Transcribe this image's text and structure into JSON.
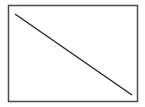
{
  "diagram": {
    "frame": {
      "x": 8.5,
      "y": 5.5,
      "width": 129,
      "height": 96,
      "stroke": "#4a4a4a",
      "stroke_width": 1.5
    },
    "line": {
      "x1": 15,
      "y1": 14,
      "x2": 132,
      "y2": 95,
      "stroke": "#2a2a2a",
      "stroke_width": 1.5
    }
  }
}
